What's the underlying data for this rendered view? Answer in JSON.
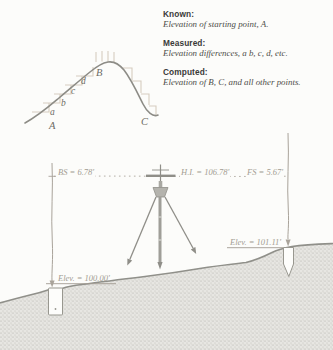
{
  "info_panel": {
    "blocks": [
      {
        "label": "Known:",
        "text": "Elevation of starting point, A."
      },
      {
        "label": "Measured:",
        "text": "Elevation differences, a b, c, d, etc."
      },
      {
        "label": "Computed:",
        "text": "Elevation of B, C, and all other points."
      }
    ]
  },
  "hill_diagram": {
    "labels": {
      "A": "A",
      "a": "a",
      "b": "b",
      "c": "c",
      "d": "d",
      "B": "B",
      "C": "C"
    }
  },
  "leveling_diagram": {
    "backsight": "BS = 6.78'",
    "instrument_height": "H.I. = 106.78'",
    "foresight": "FS = 5.67'",
    "elevation_left": "Elev. = 100.00'",
    "elevation_right": "Elev. = 101.11'"
  },
  "colors": {
    "background": "#fcfcfa",
    "curve_gray": "#8d8c86",
    "step_tan": "#d5ccbf",
    "terrain_edge": "#90908a",
    "light_line": "#b0aaa2",
    "label_gray": "#a39c92"
  }
}
